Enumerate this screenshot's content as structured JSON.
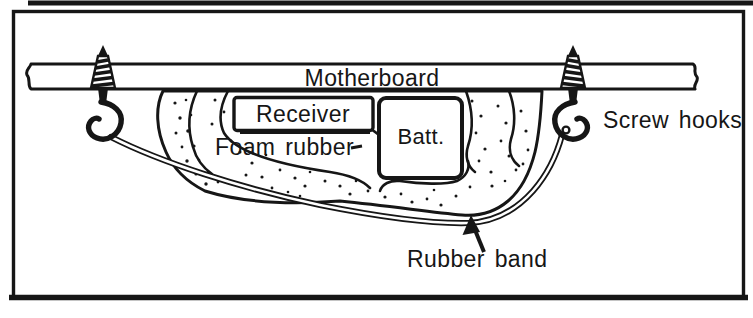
{
  "diagram": {
    "labels": {
      "motherboard": "Motherboard",
      "receiver": "Receiver",
      "battery": "Batt.",
      "foam_rubber": "Foam rubber",
      "screw_hooks": "Screw hooks",
      "rubber_band": "Rubber band"
    },
    "colors": {
      "ink": "#161616",
      "paper": "#ffffff"
    }
  }
}
